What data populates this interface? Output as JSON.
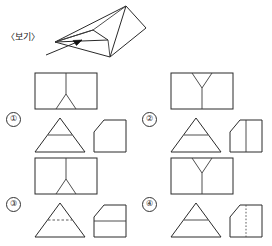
{
  "figure": {
    "label": "〈보기〉",
    "object_name": "triangular-prism",
    "annotation_icon": "arrow-icon"
  },
  "options": [
    {
      "number": "①",
      "net_rectangle": {
        "name": "rectangle-with-inverted-y",
        "stem": "top",
        "legs": "down-splayed",
        "line_style": "solid"
      },
      "cross_section_triangle": {
        "name": "triangle-with-horizontal-line",
        "line_style": "solid",
        "line_orientation": "horizontal"
      },
      "side_shape": {
        "name": "square-with-cut-top-left-corner",
        "inner_line": "none",
        "line_style": "none"
      }
    },
    {
      "number": "②",
      "net_rectangle": {
        "name": "rectangle-with-upright-y",
        "stem": "bottom",
        "legs": "up-splayed",
        "line_style": "solid"
      },
      "cross_section_triangle": {
        "name": "triangle-with-horizontal-line",
        "line_style": "solid",
        "line_orientation": "horizontal"
      },
      "side_shape": {
        "name": "square-with-cut-top-left-corner",
        "inner_line": "vertical",
        "line_style": "solid"
      }
    },
    {
      "number": "③",
      "net_rectangle": {
        "name": "rectangle-with-inverted-y",
        "stem": "top",
        "legs": "down-splayed",
        "line_style": "solid"
      },
      "cross_section_triangle": {
        "name": "triangle-with-dashed-horizontal-line",
        "line_style": "dashed",
        "line_orientation": "horizontal"
      },
      "side_shape": {
        "name": "square-with-cut-top-left-corner",
        "inner_line": "horizontal",
        "line_style": "solid"
      }
    },
    {
      "number": "④",
      "net_rectangle": {
        "name": "rectangle-with-upright-y",
        "stem": "bottom",
        "legs": "up-splayed",
        "line_style": "solid"
      },
      "cross_section_triangle": {
        "name": "triangle-with-horizontal-line",
        "line_style": "solid",
        "line_orientation": "horizontal"
      },
      "side_shape": {
        "name": "square-with-cut-top-left-corner",
        "inner_line": "vertical",
        "line_style": "dotted"
      }
    }
  ],
  "colors": {
    "ink": "#2a2a2a",
    "background": "#ffffff",
    "arrow": "#111111"
  }
}
